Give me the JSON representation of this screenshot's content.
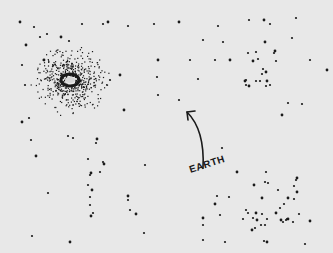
{
  "scene": {
    "background": "#e8e8e8",
    "ink": "#1a1a1a",
    "label": {
      "text": "EARTH",
      "x": 191,
      "y": 176
    },
    "arrow": {
      "from": [
        203,
        168
      ],
      "via": [
        205,
        130
      ],
      "to": [
        187,
        112
      ]
    },
    "galaxy": {
      "cx": 70,
      "cy": 80,
      "r_core": 7,
      "r_halo": 38
    },
    "stars": [
      [
        20,
        22
      ],
      [
        34,
        27
      ],
      [
        47,
        34
      ],
      [
        61,
        37
      ],
      [
        82,
        24
      ],
      [
        103,
        24
      ],
      [
        108,
        22
      ],
      [
        128,
        26
      ],
      [
        154,
        24
      ],
      [
        179,
        22
      ],
      [
        218,
        26
      ],
      [
        249,
        20
      ],
      [
        264,
        20
      ],
      [
        270,
        24
      ],
      [
        296,
        18
      ],
      [
        26,
        45
      ],
      [
        40,
        37
      ],
      [
        69,
        41
      ],
      [
        44,
        60
      ],
      [
        22,
        65
      ],
      [
        25,
        85
      ],
      [
        158,
        60
      ],
      [
        157,
        77
      ],
      [
        158,
        95
      ],
      [
        124,
        110
      ],
      [
        203,
        40
      ],
      [
        223,
        42
      ],
      [
        265,
        42
      ],
      [
        292,
        38
      ],
      [
        215,
        60
      ],
      [
        230,
        60
      ],
      [
        248,
        53
      ],
      [
        256,
        52
      ],
      [
        253,
        61
      ],
      [
        258,
        59
      ],
      [
        274,
        53
      ],
      [
        275,
        51
      ],
      [
        276,
        61
      ],
      [
        263,
        69
      ],
      [
        266,
        72
      ],
      [
        262,
        74
      ],
      [
        246,
        80
      ],
      [
        245,
        81
      ],
      [
        256,
        81
      ],
      [
        260,
        81
      ],
      [
        267,
        81
      ],
      [
        266,
        86
      ],
      [
        246,
        85
      ],
      [
        249,
        86
      ],
      [
        310,
        60
      ],
      [
        302,
        104
      ],
      [
        282,
        115
      ],
      [
        270,
        85
      ],
      [
        288,
        103
      ],
      [
        327,
        70
      ],
      [
        190,
        60
      ],
      [
        110,
        80
      ],
      [
        120,
        75
      ],
      [
        179,
        100
      ],
      [
        198,
        79
      ],
      [
        22,
        122
      ],
      [
        29,
        118
      ],
      [
        31,
        140
      ],
      [
        36,
        156
      ],
      [
        73,
        138
      ],
      [
        68,
        136
      ],
      [
        97,
        139
      ],
      [
        96,
        143
      ],
      [
        88,
        159
      ],
      [
        104,
        164
      ],
      [
        103,
        162
      ],
      [
        100,
        172
      ],
      [
        91,
        173
      ],
      [
        90,
        175
      ],
      [
        88,
        185
      ],
      [
        92,
        190
      ],
      [
        90,
        197
      ],
      [
        90,
        205
      ],
      [
        91,
        216
      ],
      [
        93,
        213
      ],
      [
        48,
        193
      ],
      [
        128,
        196
      ],
      [
        128,
        200
      ],
      [
        130,
        210
      ],
      [
        136,
        214
      ],
      [
        144,
        233
      ],
      [
        32,
        236
      ],
      [
        70,
        242
      ],
      [
        145,
        165
      ],
      [
        222,
        148
      ],
      [
        237,
        172
      ],
      [
        266,
        172
      ],
      [
        265,
        182
      ],
      [
        254,
        185
      ],
      [
        268,
        183
      ],
      [
        278,
        190
      ],
      [
        288,
        198
      ],
      [
        284,
        204
      ],
      [
        294,
        199
      ],
      [
        297,
        192
      ],
      [
        294,
        186
      ],
      [
        296,
        180
      ],
      [
        297,
        178
      ],
      [
        246,
        210
      ],
      [
        248,
        213
      ],
      [
        256,
        213
      ],
      [
        262,
        214
      ],
      [
        253,
        218
      ],
      [
        257,
        220
      ],
      [
        243,
        219
      ],
      [
        267,
        219
      ],
      [
        276,
        213
      ],
      [
        280,
        208
      ],
      [
        283,
        222
      ],
      [
        281,
        220
      ],
      [
        286,
        220
      ],
      [
        287,
        219
      ],
      [
        288,
        219
      ],
      [
        293,
        222
      ],
      [
        299,
        214
      ],
      [
        252,
        230
      ],
      [
        261,
        225
      ],
      [
        265,
        225
      ],
      [
        310,
        221
      ],
      [
        264,
        241
      ],
      [
        305,
        244
      ],
      [
        267,
        242
      ],
      [
        203,
        240
      ],
      [
        225,
        242
      ],
      [
        215,
        204
      ],
      [
        229,
        197
      ],
      [
        217,
        196
      ],
      [
        262,
        198
      ],
      [
        255,
        228
      ],
      [
        220,
        215
      ],
      [
        203,
        218
      ],
      [
        203,
        225
      ]
    ]
  }
}
